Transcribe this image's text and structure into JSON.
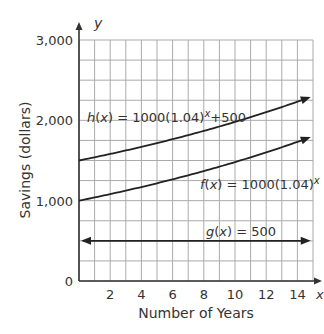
{
  "chart_data": {
    "type": "line",
    "title": "",
    "xlabel": "Number of Years",
    "ylabel": "Savings (dollars)",
    "x_axis_letter": "x",
    "y_axis_letter": "y",
    "xlim": [
      0,
      15
    ],
    "ylim": [
      0,
      3000
    ],
    "x_ticks": [
      2,
      4,
      6,
      8,
      10,
      12,
      14
    ],
    "x_tick_labels": [
      "2",
      "4",
      "6",
      "8",
      "10",
      "12",
      "14"
    ],
    "y_ticks": [
      0,
      1000,
      2000,
      3000
    ],
    "y_tick_labels": [
      "0",
      "1,000",
      "2,000",
      "3,000"
    ],
    "grid": true,
    "grid_x_step": 1,
    "grid_y_step": 250,
    "series": [
      {
        "name": "h(x) = 1000(1.04)^x + 500",
        "label": "h(x) = 1000(1.04)x+500",
        "formula": "1000*1.04^x+500",
        "x": [
          0,
          2,
          4,
          6,
          8,
          10,
          12,
          14,
          15
        ],
        "values": [
          1500,
          1582,
          1670,
          1765,
          1869,
          1980,
          2101,
          2232,
          2301
        ]
      },
      {
        "name": "f(x) = 1000(1.04)^x",
        "label": "f(x) = 1000(1.04)x",
        "formula": "1000*1.04^x",
        "x": [
          0,
          2,
          4,
          6,
          8,
          10,
          12,
          14,
          15
        ],
        "values": [
          1000,
          1082,
          1170,
          1265,
          1369,
          1480,
          1601,
          1732,
          1801
        ]
      },
      {
        "name": "g(x) = 500",
        "label": "g(x) = 500",
        "formula": "500",
        "x": [
          0,
          15
        ],
        "values": [
          500,
          500
        ]
      }
    ],
    "annotations": [
      "h(x) = 1000(1.04)x+500",
      "f(x) = 1000(1.04)x",
      "g(x) = 500"
    ]
  },
  "labels": {
    "h_prefix": "h",
    "h_mid": "(",
    "h_x": "x",
    "h_rest": ") = 1000(1.04)",
    "h_exp": "x",
    "h_tail": "+500",
    "f_prefix": "f",
    "f_open": "(",
    "f_x": "x",
    "f_rest": ") = 1000(1.04)",
    "f_exp": "x",
    "g_prefix": "g",
    "g_open": "(",
    "g_x": "x",
    "g_rest": ") = 500"
  }
}
